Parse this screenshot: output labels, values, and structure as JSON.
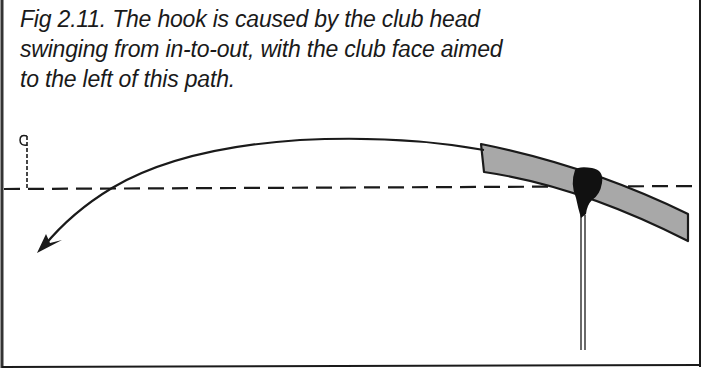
{
  "figure": {
    "caption_lines": [
      "Fig 2.11. The hook is caused by the club head",
      "swinging from in-to-out, with the club face aimed",
      "to the left of this path."
    ]
  },
  "diagram": {
    "elements": [
      "target-flag",
      "target-line (dashed, horizontal)",
      "ball-flight-path (curving right-to-left, hook)",
      "arrowhead (pointing down-left)",
      "club-swing-path (grey band, in-to-out)",
      "club-head (black)",
      "club-shaft (vertical)"
    ],
    "colors": {
      "ink": "#1a1a1a",
      "swing_path_fill": "#a8a8a8",
      "background": "#ffffff"
    }
  }
}
